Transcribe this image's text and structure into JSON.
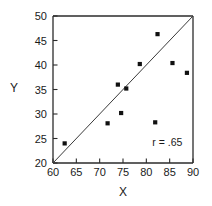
{
  "chart_data": {
    "type": "scatter",
    "title": "",
    "xlabel": "X",
    "ylabel": "Y",
    "xlim": [
      60,
      90
    ],
    "ylim": [
      20,
      50
    ],
    "xticks": [
      60,
      65,
      70,
      75,
      80,
      85,
      90
    ],
    "yticks": [
      20,
      25,
      30,
      35,
      40,
      45,
      50
    ],
    "xtick_labels": [
      "60",
      "65",
      "70",
      "75",
      "80",
      "85",
      "90"
    ],
    "ytick_labels": [
      "20",
      "25",
      "30",
      "35",
      "40",
      "45",
      "50"
    ],
    "grid": false,
    "legend": false,
    "points": [
      {
        "x": 62.5,
        "y": 24.0
      },
      {
        "x": 71.7,
        "y": 28.1
      },
      {
        "x": 73.9,
        "y": 36.0
      },
      {
        "x": 74.6,
        "y": 30.2
      },
      {
        "x": 75.7,
        "y": 35.2
      },
      {
        "x": 78.6,
        "y": 40.2
      },
      {
        "x": 81.9,
        "y": 28.3
      },
      {
        "x": 82.4,
        "y": 46.3
      },
      {
        "x": 85.6,
        "y": 40.4
      },
      {
        "x": 88.7,
        "y": 38.4
      }
    ],
    "reference_line": {
      "x1": 60,
      "y1": 20,
      "x2": 90,
      "y2": 50
    },
    "annotations": [
      {
        "text": "r = .65",
        "x": 84.5,
        "y": 23.5
      }
    ],
    "colors": {
      "point": "#111111",
      "line": "#3a3a3a",
      "axis": "#2b2b2b",
      "text": "#1a1a1a",
      "background": "#ffffff"
    }
  }
}
